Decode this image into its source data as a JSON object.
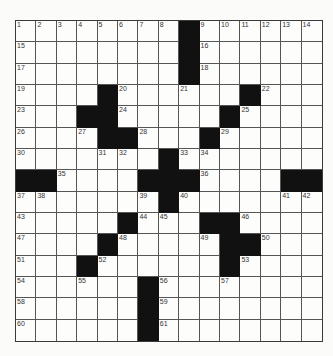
{
  "puzzle": {
    "rows": 15,
    "cols": 15,
    "colors": {
      "background": "#fbfbfa",
      "cell": "#fdfdfc",
      "block": "#111111",
      "line": "#555555",
      "number": "#333333"
    },
    "grid": [
      ".........#......",
      "........#......",
      "........#......",
      "....#......#...",
      "...##.....#....",
      "....##...#.....",
      ".......#.......",
      "##....###....##",
      ".......#.......",
      ".....#...##....",
      "....#.....##...",
      "...#......#....",
      "......#........",
      "......#........",
      "......#........"
    ],
    "blocks": [
      [
        0,
        8
      ],
      [
        1,
        8
      ],
      [
        2,
        8
      ],
      [
        3,
        4
      ],
      [
        3,
        11
      ],
      [
        4,
        3
      ],
      [
        4,
        4
      ],
      [
        4,
        10
      ],
      [
        5,
        4
      ],
      [
        5,
        5
      ],
      [
        5,
        9
      ],
      [
        6,
        7
      ],
      [
        7,
        0
      ],
      [
        7,
        1
      ],
      [
        7,
        6
      ],
      [
        7,
        7
      ],
      [
        7,
        8
      ],
      [
        7,
        13
      ],
      [
        7,
        14
      ],
      [
        8,
        7
      ],
      [
        9,
        5
      ],
      [
        9,
        9
      ],
      [
        9,
        10
      ],
      [
        10,
        4
      ],
      [
        10,
        10
      ],
      [
        10,
        11
      ],
      [
        11,
        3
      ],
      [
        11,
        10
      ],
      [
        12,
        6
      ],
      [
        13,
        6
      ],
      [
        14,
        6
      ]
    ],
    "numbers": [
      {
        "r": 0,
        "c": 0,
        "n": "1"
      },
      {
        "r": 0,
        "c": 1,
        "n": "2"
      },
      {
        "r": 0,
        "c": 2,
        "n": "3"
      },
      {
        "r": 0,
        "c": 3,
        "n": "4"
      },
      {
        "r": 0,
        "c": 4,
        "n": "5"
      },
      {
        "r": 0,
        "c": 5,
        "n": "6"
      },
      {
        "r": 0,
        "c": 6,
        "n": "7"
      },
      {
        "r": 0,
        "c": 7,
        "n": "8"
      },
      {
        "r": 0,
        "c": 9,
        "n": "9"
      },
      {
        "r": 0,
        "c": 10,
        "n": "10"
      },
      {
        "r": 0,
        "c": 11,
        "n": "11"
      },
      {
        "r": 0,
        "c": 12,
        "n": "12"
      },
      {
        "r": 0,
        "c": 13,
        "n": "13"
      },
      {
        "r": 0,
        "c": 14,
        "n": "14"
      },
      {
        "r": 1,
        "c": 0,
        "n": "15"
      },
      {
        "r": 1,
        "c": 9,
        "n": "16"
      },
      {
        "r": 2,
        "c": 0,
        "n": "17"
      },
      {
        "r": 2,
        "c": 9,
        "n": "18"
      },
      {
        "r": 3,
        "c": 0,
        "n": "19"
      },
      {
        "r": 3,
        "c": 5,
        "n": "20"
      },
      {
        "r": 3,
        "c": 8,
        "n": "21"
      },
      {
        "r": 3,
        "c": 12,
        "n": "22"
      },
      {
        "r": 4,
        "c": 0,
        "n": "23"
      },
      {
        "r": 4,
        "c": 5,
        "n": "24"
      },
      {
        "r": 4,
        "c": 11,
        "n": "25"
      },
      {
        "r": 5,
        "c": 0,
        "n": "26"
      },
      {
        "r": 5,
        "c": 3,
        "n": "27"
      },
      {
        "r": 5,
        "c": 6,
        "n": "28"
      },
      {
        "r": 5,
        "c": 10,
        "n": "29"
      },
      {
        "r": 6,
        "c": 0,
        "n": "30"
      },
      {
        "r": 6,
        "c": 4,
        "n": "31"
      },
      {
        "r": 6,
        "c": 5,
        "n": "32"
      },
      {
        "r": 6,
        "c": 8,
        "n": "33"
      },
      {
        "r": 6,
        "c": 9,
        "n": "34"
      },
      {
        "r": 7,
        "c": 2,
        "n": "35"
      },
      {
        "r": 7,
        "c": 9,
        "n": "36"
      },
      {
        "r": 8,
        "c": 0,
        "n": "37"
      },
      {
        "r": 8,
        "c": 1,
        "n": "38"
      },
      {
        "r": 8,
        "c": 6,
        "n": "39"
      },
      {
        "r": 8,
        "c": 8,
        "n": "40"
      },
      {
        "r": 8,
        "c": 13,
        "n": "41"
      },
      {
        "r": 8,
        "c": 14,
        "n": "42"
      },
      {
        "r": 9,
        "c": 0,
        "n": "43"
      },
      {
        "r": 9,
        "c": 6,
        "n": "44"
      },
      {
        "r": 9,
        "c": 7,
        "n": "45"
      },
      {
        "r": 9,
        "c": 11,
        "n": "46"
      },
      {
        "r": 10,
        "c": 0,
        "n": "47"
      },
      {
        "r": 10,
        "c": 5,
        "n": "48"
      },
      {
        "r": 10,
        "c": 9,
        "n": "49"
      },
      {
        "r": 10,
        "c": 12,
        "n": "50"
      },
      {
        "r": 11,
        "c": 0,
        "n": "51"
      },
      {
        "r": 11,
        "c": 4,
        "n": "52"
      },
      {
        "r": 11,
        "c": 11,
        "n": "53"
      },
      {
        "r": 12,
        "c": 0,
        "n": "54"
      },
      {
        "r": 12,
        "c": 3,
        "n": "55"
      },
      {
        "r": 12,
        "c": 7,
        "n": "56"
      },
      {
        "r": 12,
        "c": 10,
        "n": "57"
      },
      {
        "r": 13,
        "c": 0,
        "n": "58"
      },
      {
        "r": 13,
        "c": 7,
        "n": "59"
      },
      {
        "r": 14,
        "c": 0,
        "n": "60"
      },
      {
        "r": 14,
        "c": 7,
        "n": "61"
      }
    ]
  }
}
